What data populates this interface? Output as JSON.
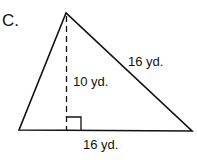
{
  "figure": {
    "label": "C.",
    "shape": "triangle",
    "height_label": "10 yd.",
    "side_label": "16 yd.",
    "base_label": "16 yd.",
    "stroke_color": "#111111",
    "background": "#ffffff"
  }
}
